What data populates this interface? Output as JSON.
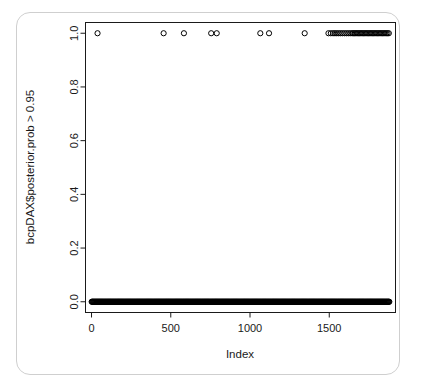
{
  "figure": {
    "title": "",
    "background_color": "#ffffff",
    "frame_color": "#1a1a1a",
    "border_color": "#cfcfcf",
    "point_color": "#000000",
    "point_symbol": "open-circle"
  },
  "chart_data": {
    "type": "scatter",
    "title": "",
    "xlabel": "Index",
    "ylabel": "bcpDAX$posterior.prob > 0.95",
    "xlim": [
      -38,
      1918
    ],
    "ylim": [
      -0.04,
      1.04
    ],
    "xticks": [
      0,
      500,
      1000,
      1500
    ],
    "xticklabels": [
      "0",
      "500",
      "1000",
      "1500"
    ],
    "yticks": [
      0.0,
      0.2,
      0.4,
      0.6,
      0.8,
      1.0
    ],
    "yticklabels": [
      "0.0",
      "0.2",
      "0.4",
      "0.6",
      "0.8",
      "1.0"
    ],
    "grid": false,
    "legend": null,
    "n_points": 1880,
    "series": [
      {
        "name": "posterior.prob > 0.95 (TRUE)",
        "y_value": 1.0,
        "x": [
          38,
          455,
          583,
          755,
          790,
          1065,
          1120,
          1345,
          1495,
          1510,
          1524,
          1536,
          1548,
          1560,
          1572,
          1584,
          1596,
          1608,
          1620,
          1632,
          1644,
          1652,
          1660,
          1668,
          1676,
          1684,
          1692,
          1700,
          1708,
          1716,
          1724,
          1732,
          1740,
          1748,
          1756,
          1764,
          1772,
          1780,
          1788,
          1796,
          1804,
          1812,
          1820,
          1828,
          1836,
          1844,
          1852,
          1860,
          1868,
          1876
        ]
      },
      {
        "name": "posterior.prob > 0.95 (FALSE)",
        "y_value": 0.0,
        "x_range": [
          1,
          1880
        ],
        "x_step": 3,
        "description": "dense overlapping band of open circles along y = 0.0 spanning the full index range"
      }
    ]
  }
}
